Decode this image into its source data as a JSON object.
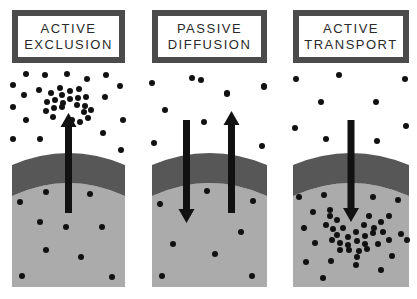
{
  "diagram": {
    "colors": {
      "background": "#ffffff",
      "title_border": "#4b4b4b",
      "title_text": "#2a2a2a",
      "membrane": "#575757",
      "cytoplasm": "#ababab",
      "particle": "#111111",
      "arrow": "#111111"
    },
    "panels": [
      {
        "id": "active-exclusion",
        "title_lines": [
          "ACTIVE",
          "EXCLUSION"
        ],
        "title": "ACTIVE EXCLUSION",
        "box": {
          "x": 12,
          "w": 113
        },
        "title_box": {
          "x": 12,
          "w": 113
        },
        "arrows": [
          {
            "direction": "up",
            "x": 68.5,
            "y_tail": 213,
            "y_tip": 113
          }
        ],
        "particles_outside": [
          [
            13,
            85
          ],
          [
            26,
            74
          ],
          [
            45,
            75
          ],
          [
            67,
            74
          ],
          [
            87,
            79
          ],
          [
            106,
            75
          ],
          [
            24,
            95
          ],
          [
            39,
            90
          ],
          [
            120,
            86
          ],
          [
            13,
            107
          ],
          [
            26,
            120
          ],
          [
            105,
            97
          ],
          [
            13,
            139
          ],
          [
            40,
            139
          ],
          [
            103,
            133
          ],
          [
            121,
            150
          ],
          [
            123,
            120
          ]
        ],
        "particles_cluster": [
          [
            60,
            88
          ],
          [
            51,
            93
          ],
          [
            62,
            95
          ],
          [
            70,
            91
          ],
          [
            79,
            89
          ],
          [
            47,
            102
          ],
          [
            55,
            100
          ],
          [
            63,
            103
          ],
          [
            70,
            99
          ],
          [
            78,
            98
          ],
          [
            86,
            97
          ],
          [
            46,
            111
          ],
          [
            54,
            108
          ],
          [
            62,
            107
          ],
          [
            77,
            105
          ],
          [
            85,
            106
          ],
          [
            91,
            110
          ],
          [
            53,
            117
          ],
          [
            84,
            112
          ],
          [
            88,
            118
          ],
          [
            80,
            122
          ],
          [
            72,
            120
          ]
        ],
        "particles_inside": [
          [
            46,
            192
          ],
          [
            20,
            202
          ],
          [
            90,
            194
          ],
          [
            40,
            222
          ],
          [
            66,
            227
          ],
          [
            102,
            227
          ],
          [
            46,
            250
          ],
          [
            81,
            257
          ],
          [
            22,
            276
          ],
          [
            112,
            277
          ]
        ]
      },
      {
        "id": "passive-diffusion",
        "title_lines": [
          "PASSIVE",
          "DIFFUSION"
        ],
        "title": "PASSIVE DIFFUSION",
        "box": {
          "x": 152,
          "w": 115
        },
        "title_box": {
          "x": 152,
          "w": 115
        },
        "arrows": [
          {
            "direction": "down",
            "x": 186.5,
            "y_tail": 120,
            "y_tip": 223
          },
          {
            "direction": "up",
            "x": 231.5,
            "y_tail": 213,
            "y_tip": 111
          }
        ],
        "particles_outside": [
          [
            152,
            83
          ],
          [
            192,
            78
          ],
          [
            227,
            93
          ],
          [
            264,
            87
          ],
          [
            165,
            110
          ],
          [
            201,
            80
          ],
          [
            227,
            94
          ],
          [
            264,
            86
          ],
          [
            204,
            122
          ],
          [
            154,
            143
          ],
          [
            262,
            146
          ]
        ],
        "particles_inside": [
          [
            207,
            191
          ],
          [
            160,
            204
          ],
          [
            253,
            201
          ],
          [
            241,
            232
          ],
          [
            173,
            244
          ],
          [
            215,
            254
          ],
          [
            162,
            276
          ],
          [
            252,
            276
          ]
        ]
      },
      {
        "id": "active-transport",
        "title_lines": [
          "ACTIVE",
          "TRANSPORT"
        ],
        "title": "ACTIVE TRANSPORT",
        "box": {
          "x": 293,
          "w": 116
        },
        "title_box": {
          "x": 293,
          "w": 116
        },
        "arrows": [
          {
            "direction": "down",
            "x": 351,
            "y_tail": 120,
            "y_tip": 222
          }
        ],
        "particles_outside": [
          [
            296,
            79
          ],
          [
            339,
            75
          ],
          [
            405,
            79
          ],
          [
            321,
            102
          ],
          [
            376,
            102
          ],
          [
            295,
            128
          ],
          [
            406,
            126
          ],
          [
            326,
            139
          ],
          [
            377,
            141
          ]
        ],
        "particles_inside": [
          [
            299,
            197
          ],
          [
            324,
            195
          ],
          [
            373,
            197
          ],
          [
            398,
            200
          ],
          [
            313,
            212
          ],
          [
            330,
            210
          ],
          [
            389,
            216
          ],
          [
            304,
            228
          ],
          [
            401,
            234
          ],
          [
            315,
            243
          ],
          [
            407,
            240
          ],
          [
            306,
            262
          ],
          [
            331,
            261
          ],
          [
            356,
            265
          ],
          [
            381,
            270
          ],
          [
            389,
            240
          ],
          [
            392,
            256
          ],
          [
            323,
            278
          ]
        ],
        "particles_cluster": [
          [
            330,
            216
          ],
          [
            337,
            220
          ],
          [
            369,
            216
          ],
          [
            381,
            222
          ],
          [
            326,
            225
          ],
          [
            333,
            229
          ],
          [
            343,
            228
          ],
          [
            364,
            225
          ],
          [
            374,
            228
          ],
          [
            337,
            235
          ],
          [
            348,
            237
          ],
          [
            356,
            232
          ],
          [
            365,
            236
          ],
          [
            373,
            233
          ],
          [
            383,
            232
          ],
          [
            332,
            240
          ],
          [
            340,
            243
          ],
          [
            348,
            245
          ],
          [
            357,
            241
          ],
          [
            365,
            244
          ],
          [
            378,
            244
          ],
          [
            340,
            250
          ],
          [
            349,
            250
          ],
          [
            359,
            251
          ],
          [
            367,
            249
          ],
          [
            357,
            257
          ]
        ]
      }
    ],
    "membrane": {
      "top_center_y": 153,
      "top_edge_y": 165,
      "bottom_center_y": 183,
      "bottom_edge_y": 196,
      "interior_bottom_y": 287
    },
    "particle_radius": 3
  }
}
